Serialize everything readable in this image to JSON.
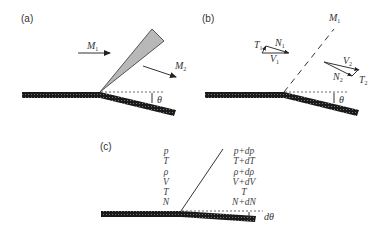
{
  "figure": {
    "panels": [
      {
        "id": "a",
        "label": "(a)",
        "upstream_mach": {
          "symbol": "M",
          "subscript": "1"
        },
        "downstream_mach": {
          "symbol": "M",
          "subscript": "2"
        },
        "angle": "θ",
        "wave_type": "expansion-fan"
      },
      {
        "id": "b",
        "label": "(b)",
        "wave_mach": {
          "symbol": "M",
          "subscript": "1"
        },
        "upstream_vectors": {
          "tangential": {
            "symbol": "T",
            "subscript": "1"
          },
          "normal": {
            "symbol": "N",
            "subscript": "1"
          },
          "velocity": {
            "symbol": "V",
            "subscript": "1"
          }
        },
        "downstream_vectors": {
          "velocity": {
            "symbol": "V",
            "subscript": "2"
          },
          "normal": {
            "symbol": "N",
            "subscript": "2"
          },
          "tangential": {
            "symbol": "T",
            "subscript": "2"
          }
        },
        "angle": "θ",
        "wave_type": "mach-line"
      },
      {
        "id": "c",
        "label": "(c)",
        "upstream_properties": [
          "p",
          "T",
          "ρ",
          "V",
          "T",
          "N"
        ],
        "downstream_properties": [
          "p+dp",
          "T+dT",
          "ρ+dρ",
          "V+dV",
          "T",
          "N+dN"
        ],
        "angle": "dθ",
        "wave_type": "infinitesimal-wave"
      }
    ]
  },
  "colors": {
    "wall": "#1a1a1a",
    "fan_fill": "#b8b8b8",
    "line": "#333333"
  }
}
